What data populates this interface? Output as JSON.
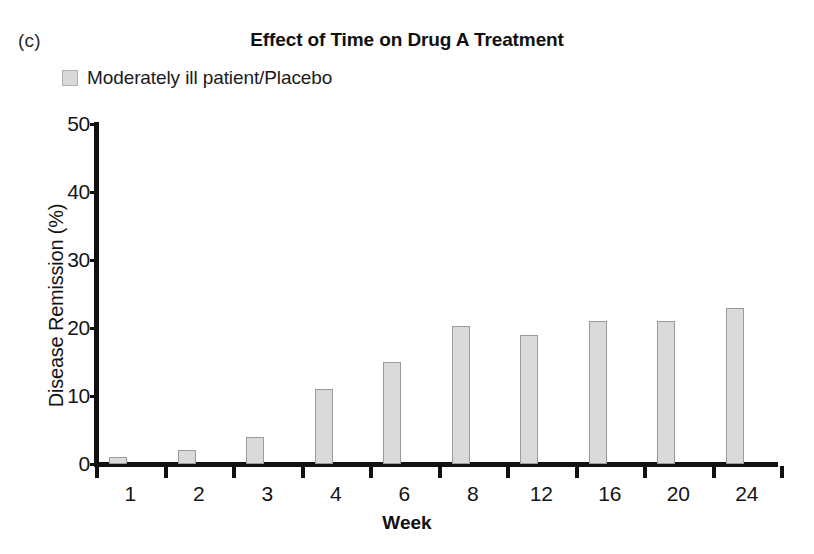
{
  "panel": {
    "label": "(c)"
  },
  "title": "Effect of Time on Drug A Treatment",
  "legend": {
    "position": "top-left",
    "entries": [
      {
        "label": "Moderately ill patient/Placebo",
        "color": "#d9d9d9",
        "swatch_icon": "square-swatch-icon"
      }
    ]
  },
  "axes": {
    "x_title": "Week",
    "y_title": "Disease Remission (%)",
    "y_ticks": [
      "0",
      "10",
      "20",
      "30",
      "40",
      "50"
    ],
    "x_ticks": [
      "1",
      "2",
      "3",
      "4",
      "6",
      "8",
      "12",
      "16",
      "20",
      "24"
    ]
  },
  "chart_data": {
    "type": "bar",
    "title": "Effect of Time on Drug A Treatment",
    "panel_label": "(c)",
    "xlabel": "Week",
    "ylabel": "Disease Remission (%)",
    "categories": [
      "1",
      "2",
      "3",
      "4",
      "6",
      "8",
      "12",
      "16",
      "20",
      "24"
    ],
    "values": [
      1,
      2,
      4,
      11,
      15,
      20.3,
      19,
      21,
      21,
      23
    ],
    "series": [
      {
        "name": "Moderately ill patient/Placebo",
        "color": "#d9d9d9",
        "values": [
          1,
          2,
          4,
          11,
          15,
          20.3,
          19,
          21,
          21,
          23
        ]
      }
    ],
    "ylim": [
      0,
      50
    ],
    "ytick_step": 10,
    "grid": false,
    "legend_position": "top-left",
    "bar_fill": "#dadada",
    "bar_edge": "#9a9a9a",
    "axis_color": "#111111"
  }
}
